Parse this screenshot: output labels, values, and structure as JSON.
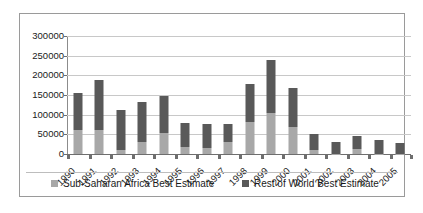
{
  "chart_data": {
    "type": "bar",
    "stacked": true,
    "title": "",
    "subtitle": "",
    "xlabel": "",
    "ylabel": "",
    "grid": true,
    "legend_position": "bottom",
    "ylim": [
      0,
      300000
    ],
    "yticks": [
      0,
      50000,
      100000,
      150000,
      200000,
      250000,
      300000
    ],
    "ytick_labels": [
      "0",
      "50000",
      "100000",
      "150000",
      "200000",
      "250000",
      "300000"
    ],
    "categories": [
      "1990",
      "1991",
      "1992",
      "1993",
      "1994",
      "1995",
      "1996",
      "1997",
      "1998",
      "1999",
      "2000",
      "2001",
      "2002",
      "2003",
      "2004",
      "2005"
    ],
    "series": [
      {
        "name": "Sub-Saharan Africa Best Estimate",
        "color": "#a8a8a8",
        "values": [
          60000,
          62000,
          10000,
          30000,
          53000,
          19000,
          16000,
          31000,
          82000,
          105000,
          68000,
          9000,
          1000,
          13000,
          1000,
          1000
        ]
      },
      {
        "name": "Rest of World Best Estimate",
        "color": "#595959",
        "values": [
          95000,
          127000,
          103000,
          103000,
          95000,
          60000,
          60000,
          46000,
          96000,
          133000,
          101000,
          43000,
          29000,
          32000,
          35000,
          26000
        ]
      }
    ],
    "totals": [
      155000,
      189000,
      113000,
      133000,
      148000,
      79000,
      76000,
      77000,
      178000,
      238000,
      169000,
      52000,
      30000,
      45000,
      36000,
      27000
    ]
  },
  "legend": {
    "entries": [
      {
        "label": "Sub-Saharan Africa Best Estimate",
        "color": "#a8a8a8"
      },
      {
        "label": "Rest of World Best Estimate",
        "color": "#595959"
      }
    ]
  }
}
